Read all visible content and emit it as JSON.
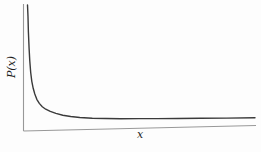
{
  "chart_data": {
    "type": "line",
    "title": "",
    "xlabel": "x",
    "ylabel": "P(x)",
    "grid": false,
    "legend": false,
    "tick_labels": "none",
    "x_range_norm": [
      0,
      1
    ],
    "y_range_norm": [
      0,
      1
    ],
    "series": [
      {
        "name": "P(x) power-law decay curve",
        "points_norm": [
          [
            0.0,
            0.992
          ],
          [
            0.002,
            0.9
          ],
          [
            0.004,
            0.78
          ],
          [
            0.007,
            0.65
          ],
          [
            0.01,
            0.55
          ],
          [
            0.014,
            0.46
          ],
          [
            0.019,
            0.39
          ],
          [
            0.025,
            0.335
          ],
          [
            0.032,
            0.29
          ],
          [
            0.041,
            0.248
          ],
          [
            0.052,
            0.215
          ],
          [
            0.065,
            0.188
          ],
          [
            0.08,
            0.168
          ],
          [
            0.1,
            0.15
          ],
          [
            0.125,
            0.133
          ],
          [
            0.155,
            0.118
          ],
          [
            0.19,
            0.106
          ],
          [
            0.23,
            0.0965
          ],
          [
            0.285,
            0.0895
          ],
          [
            0.345,
            0.0845
          ],
          [
            0.41,
            0.0805
          ],
          [
            0.49,
            0.0775
          ],
          [
            0.57,
            0.0745
          ],
          [
            0.66,
            0.0715
          ],
          [
            0.76,
            0.069
          ],
          [
            0.875,
            0.066
          ],
          [
            1.0,
            0.0635
          ]
        ]
      }
    ],
    "layout": {
      "plot_left": 23.5,
      "axis_top": 4,
      "axis_y_left": 131,
      "axis_y_right": 125.5,
      "axis_x_end": 256,
      "curve_x_start": 27.5,
      "curve_x_end": 255,
      "curve_stroke_width": 1.4,
      "axis_stroke_width": 1.1
    },
    "colors": {
      "curve": "#3a3a3a",
      "axis": "#989898",
      "label": "#1e1e1e",
      "background": "#fdfdfd"
    }
  }
}
